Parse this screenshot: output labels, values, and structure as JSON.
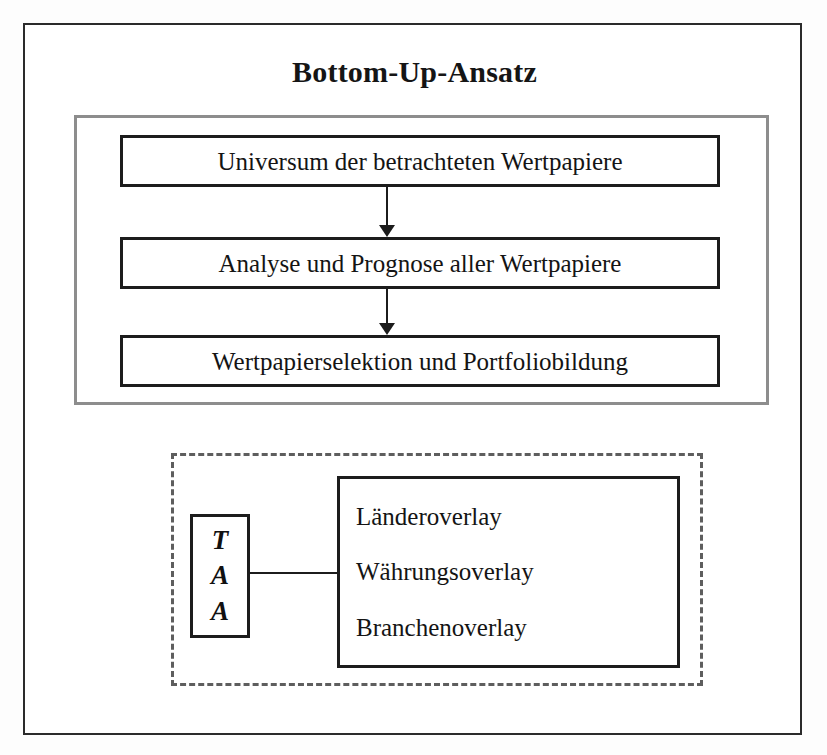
{
  "diagram": {
    "title": "Bottom-Up-Ansatz",
    "process_group": {
      "steps": [
        {
          "label": "Universum der betrachteten Wertpapiere"
        },
        {
          "label": "Analyse und Prognose aller Wertpapiere"
        },
        {
          "label": "Wertpapierselektion und Portfoliobildung"
        }
      ],
      "arrows": [
        {
          "name": "arrow-step1-to-step2",
          "direction": "down"
        },
        {
          "name": "arrow-step2-to-step3",
          "direction": "down"
        }
      ],
      "border_color": "#8d8d8d"
    },
    "taa_group": {
      "border_style": "dashed",
      "border_color": "#5e5e5e",
      "taa_box": {
        "letters": [
          "T",
          "A",
          "A"
        ],
        "meaning_abbrev": "TAA"
      },
      "connector": {
        "name": "taa-to-overlays-connector"
      },
      "overlays": [
        {
          "label": "Länderoverlay"
        },
        {
          "label": "Währungsoverlay"
        },
        {
          "label": "Branchenoverlay"
        }
      ]
    },
    "colors": {
      "frame": "#2b2b2b",
      "box_border": "#1c1c1c",
      "text": "#141414",
      "background": "#ffffff"
    }
  }
}
